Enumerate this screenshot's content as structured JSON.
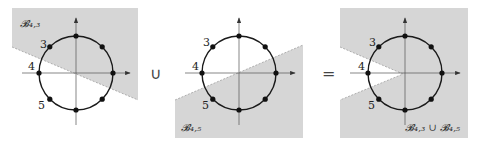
{
  "panels": [
    {
      "id": "b43",
      "set_label": "𝓑₄,₃",
      "point_labels": [
        "3",
        "4",
        "5"
      ],
      "shaded_region": "upper half-plane above line through origin (slope down-right)"
    },
    {
      "id": "b45",
      "set_label": "𝓑₄,₅",
      "point_labels": [
        "3",
        "4",
        "5"
      ],
      "shaded_region": "lower half-plane below line through origin (slope up-right)"
    },
    {
      "id": "union",
      "set_label": "𝓑₄,₃ ∪ 𝓑₄,₅",
      "point_labels": [
        "3",
        "4",
        "5"
      ],
      "shaded_region": "everything except wedge around point 4"
    }
  ],
  "operators": {
    "union": "∪",
    "equals": "="
  },
  "colors": {
    "shade": "#d6d6d6",
    "line": "#1a1a1a",
    "axis": "#555555"
  },
  "points_per_circle": 8
}
